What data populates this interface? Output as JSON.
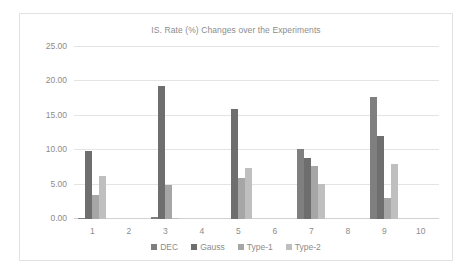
{
  "chart_data": {
    "type": "bar",
    "title": "IS. Rate (%) Changes over the Experiments",
    "xlabel": "",
    "ylabel": "",
    "ylim": [
      0,
      25
    ],
    "ytick_labels": [
      "0.00",
      "5.00",
      "10.00",
      "15.00",
      "20.00",
      "25.00"
    ],
    "ytick_values": [
      0,
      5,
      10,
      15,
      20,
      25
    ],
    "grid": true,
    "legend_position": "bottom",
    "categories": [
      "1",
      "2",
      "3",
      "4",
      "5",
      "6",
      "7",
      "8",
      "9",
      "10"
    ],
    "series": [
      {
        "name": "DEC",
        "color": "#7f7f7f",
        "values": [
          0.2,
          0,
          0.3,
          0,
          0,
          0,
          10.2,
          0,
          17.8,
          0
        ]
      },
      {
        "name": "Gauss",
        "color": "#6e6e6e",
        "values": [
          9.9,
          0,
          19.4,
          0,
          16.0,
          0,
          8.9,
          0,
          12.0,
          0
        ]
      },
      {
        "name": "Type-1",
        "color": "#a6a6a6",
        "values": [
          3.5,
          0,
          4.9,
          0,
          5.9,
          0,
          7.7,
          0,
          3.1,
          0
        ]
      },
      {
        "name": "Type-2",
        "color": "#bfbfbf",
        "values": [
          6.2,
          0,
          0.1,
          0,
          7.4,
          0,
          5.1,
          0,
          8.0,
          0
        ]
      }
    ]
  },
  "legend": {
    "items": [
      {
        "label": "DEC"
      },
      {
        "label": "Gauss"
      },
      {
        "label": "Type-1"
      },
      {
        "label": "Type-2"
      }
    ]
  },
  "colors": {
    "series_dec": "#7f7f7f",
    "series_gauss": "#6e6e6e",
    "series_type1": "#a6a6a6",
    "series_type2": "#bfbfbf",
    "gridline": "#e4e4e4",
    "text": "#8c8c8c",
    "frame_border": "#e2e2e2"
  }
}
